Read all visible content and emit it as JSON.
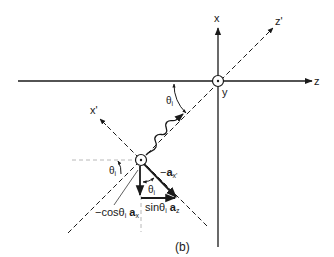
{
  "figure": {
    "caption": "(b)",
    "axes": {
      "x": "x",
      "y": "y",
      "z": "z",
      "x_prime": "x'",
      "z_prime": "z'"
    },
    "angle_labels": {
      "theta_top": "θ",
      "theta_top_sub": "i",
      "theta_left": "θ",
      "theta_left_sub": "i",
      "theta_inner": "θ",
      "theta_inner_sub": "i"
    },
    "vector_labels": {
      "neg_ax_prime_prefix": "−",
      "neg_ax_prime_vec": "a",
      "neg_ax_prime_sub": "x'",
      "sin_prefix": "sinθ",
      "sin_sub": "i",
      "sin_vec": "a",
      "sin_vec_sub": "z",
      "cos_prefix": "−cosθ",
      "cos_sub": "i",
      "cos_vec": "a",
      "cos_vec_sub": "x"
    },
    "colors": {
      "ink": "#1a1a1a",
      "guide": "#b0b0b0"
    }
  }
}
